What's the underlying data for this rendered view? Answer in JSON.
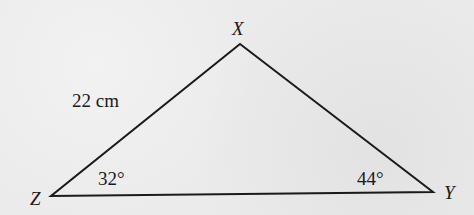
{
  "diagram": {
    "type": "triangle",
    "vertices": {
      "X": {
        "label": "X",
        "x": 240,
        "y": 44
      },
      "Y": {
        "label": "Y",
        "x": 433,
        "y": 192
      },
      "Z": {
        "label": "Z",
        "x": 51,
        "y": 196
      }
    },
    "side_labels": {
      "ZX": "22 cm"
    },
    "angle_labels": {
      "Z": "32°",
      "Y": "44°"
    },
    "stroke_color": "#1a1a1a"
  }
}
